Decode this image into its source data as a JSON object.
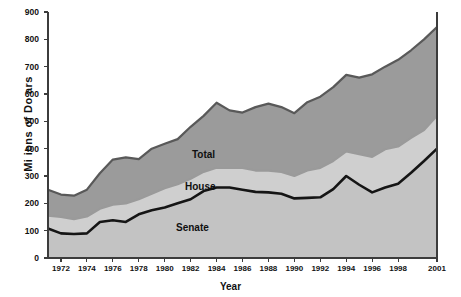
{
  "chart_data": {
    "type": "area",
    "stacked": true,
    "title": "",
    "xlabel": "Year",
    "ylabel": "Mi ions of Do ars",
    "ylabel_intended": "Millions of Dollars",
    "xlim": [
      1971,
      2001
    ],
    "ylim": [
      0,
      900
    ],
    "grid": false,
    "legend_position": "inline-annotations",
    "y_ticks": [
      0,
      100,
      200,
      300,
      400,
      500,
      600,
      700,
      800,
      900
    ],
    "x_ticks": [
      1972,
      1974,
      1976,
      1978,
      1980,
      1982,
      1984,
      1986,
      1988,
      1990,
      1992,
      1994,
      1996,
      1998,
      2001
    ],
    "x_tick_labels": [
      "1972",
      "1974",
      "1976",
      "1978",
      "1980",
      "1982",
      "1984",
      "1986",
      "1988",
      "1990",
      "1992",
      "1994",
      "1996",
      "1998",
      "2001"
    ],
    "x": [
      1971,
      1972,
      1973,
      1974,
      1975,
      1976,
      1977,
      1978,
      1979,
      1980,
      1981,
      1982,
      1983,
      1984,
      1985,
      1986,
      1987,
      1988,
      1989,
      1990,
      1991,
      1992,
      1993,
      1994,
      1995,
      1996,
      1997,
      1998,
      1999,
      2000,
      2001
    ],
    "series": [
      {
        "name": "Senate",
        "color": "#151515",
        "fill": "#c3c3c3",
        "values": [
          108,
          90,
          88,
          90,
          132,
          138,
          132,
          160,
          175,
          185,
          200,
          215,
          245,
          258,
          258,
          250,
          242,
          240,
          235,
          218,
          220,
          222,
          252,
          300,
          268,
          240,
          258,
          272,
          312,
          355,
          400
        ]
      },
      {
        "name": "House",
        "color": "#9a9a9a",
        "fill": "#cfcfcf",
        "values": [
          155,
          150,
          142,
          152,
          180,
          195,
          200,
          215,
          235,
          255,
          270,
          290,
          315,
          330,
          330,
          330,
          320,
          320,
          315,
          300,
          320,
          330,
          355,
          390,
          380,
          370,
          398,
          408,
          440,
          468,
          520
        ]
      },
      {
        "name": "Total",
        "color": "#595959",
        "fill": "#9b9b9b",
        "values": [
          250,
          232,
          228,
          250,
          310,
          360,
          368,
          362,
          400,
          418,
          435,
          480,
          520,
          568,
          540,
          532,
          552,
          565,
          552,
          530,
          570,
          590,
          625,
          670,
          660,
          672,
          700,
          725,
          760,
          800,
          845
        ]
      }
    ],
    "annotations": [
      {
        "text": "Total",
        "x": 1983,
        "y": 455
      },
      {
        "text": "House",
        "x": 1983,
        "y": 318
      },
      {
        "text": "Senate",
        "x": 1982,
        "y": 165
      }
    ]
  },
  "axes": {
    "y_title": "Mi ions of Do ars",
    "x_title": "Year"
  }
}
